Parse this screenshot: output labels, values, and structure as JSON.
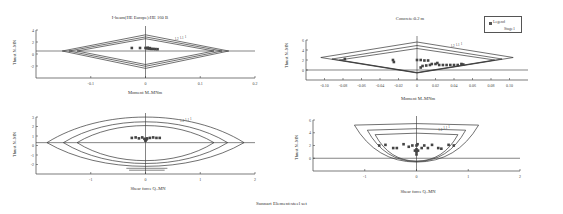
{
  "figure_caption": "Sunnart Element:steel set",
  "legend": {
    "title": "Legend",
    "entry": "Stage1"
  },
  "colors": {
    "line": "#333333",
    "marker": "#444444",
    "axis": "#444444"
  },
  "chart_data": [
    {
      "id": "beam-moment",
      "type": "scatter",
      "title": "I-beam(HE Europe):HE 160 B",
      "xlabel": "Moment M–MNm",
      "ylabel": "Thrust N–MN",
      "xlim": [
        -0.2,
        0.2
      ],
      "ylim": [
        -4,
        4
      ],
      "xticks": [
        "-0.1",
        "0",
        "0.1",
        "0.2"
      ],
      "xtick_values": [
        -0.1,
        0,
        0.1,
        0.2
      ],
      "yticks": [
        "4",
        "2",
        "0",
        "-2"
      ],
      "ytick_values": [
        4,
        2,
        0,
        -2
      ],
      "baseline_y": 0.5,
      "grid": false,
      "curve_labels": [
        "1.2",
        "1.1",
        "1"
      ],
      "envelopes": [
        {
          "name": "1",
          "shape": "diamond",
          "xmin": -0.152,
          "xmax": 0.152,
          "ytop": 3.2,
          "ybot": -2.4,
          "ymid": 0.5
        },
        {
          "name": "1.1",
          "shape": "diamond",
          "xmin": -0.14,
          "xmax": 0.14,
          "ytop": 2.85,
          "ybot": -2.05,
          "ymid": 0.5
        },
        {
          "name": "1.2",
          "shape": "diamond",
          "xmin": -0.125,
          "xmax": 0.125,
          "ytop": 2.55,
          "ybot": -1.75,
          "ymid": 0.5
        }
      ],
      "points": [
        [
          -0.025,
          1.0
        ],
        [
          -0.01,
          1.0
        ],
        [
          0.0,
          1.0
        ],
        [
          0.003,
          0.95
        ],
        [
          0.006,
          0.9
        ],
        [
          0.01,
          0.85
        ],
        [
          0.014,
          0.85
        ],
        [
          0.018,
          0.82
        ],
        [
          0.022,
          0.8
        ],
        [
          0.004,
          1.05
        ],
        [
          0.008,
          0.98
        ]
      ]
    },
    {
      "id": "concrete-moment",
      "type": "scatter",
      "title": "Concrete:0.2 m",
      "xlabel": "Moment M–MNm",
      "ylabel": "Thrust N–MN",
      "xlim": [
        -0.12,
        0.12
      ],
      "ylim": [
        -2,
        6
      ],
      "xticks": [
        "-0.10",
        "-0.08",
        "-0.06",
        "-0.04",
        "-0.02",
        "0",
        "0.02",
        "0.04",
        "0.06",
        "0.08",
        "0.10"
      ],
      "xtick_values": [
        -0.1,
        -0.08,
        -0.06,
        -0.04,
        -0.02,
        0,
        0.02,
        0.04,
        0.06,
        0.08,
        0.1
      ],
      "yticks": [
        "6",
        "4",
        "2",
        "0"
      ],
      "ytick_values": [
        6,
        4,
        2,
        0
      ],
      "baseline_y": 0,
      "grid": false,
      "curve_labels": [
        "1.2",
        "1.1",
        "1"
      ],
      "envelopes": [
        {
          "name": "1",
          "shape": "diamond",
          "xmin": -0.104,
          "xmax": 0.104,
          "ytop": 5.6,
          "ybot": -0.6,
          "ymid": 2.5,
          "ymid_r": 2.5
        },
        {
          "name": "1.1",
          "shape": "diamond",
          "xmin": -0.092,
          "xmax": 0.092,
          "ytop": 4.9,
          "ybot": -0.55,
          "ymid": 2.2,
          "ymid_r": 2.2
        },
        {
          "name": "1.2",
          "shape": "diamond",
          "xmin": -0.084,
          "xmax": 0.084,
          "ytop": 4.3,
          "ybot": -0.5,
          "ymid": 2.0,
          "ymid_r": 2.0
        }
      ],
      "points": [
        [
          -0.078,
          2.2
        ],
        [
          -0.026,
          2.0
        ],
        [
          -0.025,
          1.6
        ],
        [
          0.0,
          2.0
        ],
        [
          0.004,
          2.0
        ],
        [
          0.008,
          1.9
        ],
        [
          0.012,
          1.9
        ],
        [
          0.004,
          0.5
        ],
        [
          0.006,
          0.8
        ],
        [
          0.01,
          0.9
        ],
        [
          0.014,
          1.0
        ],
        [
          0.016,
          1.2
        ],
        [
          0.02,
          1.2
        ],
        [
          0.022,
          1.4
        ],
        [
          0.024,
          1.0
        ],
        [
          0.028,
          1.0
        ],
        [
          0.032,
          1.0
        ],
        [
          0.036,
          1.0
        ],
        [
          0.04,
          1.0
        ],
        [
          0.044,
          1.0
        ],
        [
          0.048,
          1.2
        ],
        [
          0.05,
          1.1
        ]
      ]
    },
    {
      "id": "beam-shear",
      "type": "scatter",
      "title": "",
      "xlabel": "Shear force Q–MN",
      "ylabel": "Thrust N–MN",
      "xlim": [
        -2,
        2
      ],
      "ylim": [
        -3,
        3
      ],
      "xticks": [
        "-1",
        "0",
        "1",
        "2"
      ],
      "xtick_values": [
        -1,
        0,
        1,
        2
      ],
      "yticks": [
        "3",
        "2",
        "1",
        "0",
        "-1",
        "-2"
      ],
      "ytick_values": [
        3,
        2,
        1,
        0,
        -1,
        -2
      ],
      "baseline_y": 0.3,
      "grid": false,
      "curve_labels": [
        "1.2",
        "1.1",
        "1"
      ],
      "envelopes": [
        {
          "name": "1",
          "shape": "lens",
          "xmin": -1.8,
          "xmax": 1.8,
          "ytop": 3.0,
          "ybot": -2.2,
          "ymid": 0.3
        },
        {
          "name": "1.1",
          "shape": "lens",
          "xmin": -1.5,
          "xmax": 1.5,
          "ytop": 2.5,
          "ybot": -1.9,
          "ymid": 0.3
        },
        {
          "name": "1.2",
          "shape": "lens",
          "xmin": -1.25,
          "xmax": 1.25,
          "ytop": 2.1,
          "ybot": -1.6,
          "ymid": 0.3
        }
      ],
      "extra_lines": [
        {
          "x1": -0.35,
          "x2": 0.4,
          "y": -2.4
        },
        {
          "x1": -0.3,
          "x2": 0.35,
          "y": -2.6
        }
      ],
      "points": [
        [
          -0.25,
          0.8
        ],
        [
          -0.18,
          0.85
        ],
        [
          -0.12,
          0.75
        ],
        [
          -0.06,
          0.85
        ],
        [
          0.0,
          0.6
        ],
        [
          0.0,
          0.5
        ],
        [
          0.03,
          0.75
        ],
        [
          0.08,
          0.8
        ],
        [
          0.14,
          0.85
        ],
        [
          0.2,
          0.8
        ],
        [
          0.26,
          0.8
        ],
        [
          -0.02,
          0.7
        ],
        [
          0.02,
          0.65
        ]
      ]
    },
    {
      "id": "concrete-shear",
      "type": "scatter",
      "title": "",
      "xlabel": "Shear force Q–MN",
      "ylabel": "Thrust N–MN",
      "xlim": [
        -2,
        2
      ],
      "ylim": [
        -2,
        6
      ],
      "xticks": [
        "-1",
        "0",
        "1",
        "2"
      ],
      "xtick_values": [
        -1,
        0,
        1,
        2
      ],
      "yticks": [
        "6",
        "4",
        "2",
        "0"
      ],
      "ytick_values": [
        6,
        4,
        2,
        0
      ],
      "baseline_y": 0,
      "grid": false,
      "curve_labels": [
        "1.2",
        "1.1",
        "1"
      ],
      "envelopes": [
        {
          "name": "1",
          "shape": "bowl",
          "xmin": -1.2,
          "xmax": 1.2,
          "ytop": 5.2,
          "ybot": -0.6,
          "ymid": 5.2
        },
        {
          "name": "1.1",
          "shape": "bowl",
          "xmin": -0.95,
          "xmax": 0.95,
          "ytop": 4.4,
          "ybot": -0.5,
          "ymid": 4.4
        },
        {
          "name": "1.2",
          "shape": "bowl",
          "xmin": -0.8,
          "xmax": 0.8,
          "ytop": 3.7,
          "ybot": -0.45,
          "ymid": 3.7
        }
      ],
      "points": [
        [
          -0.72,
          2.0
        ],
        [
          -0.6,
          2.1
        ],
        [
          -0.45,
          1.6
        ],
        [
          -0.38,
          1.6
        ],
        [
          -0.25,
          2.2
        ],
        [
          -0.15,
          1.8
        ],
        [
          -0.08,
          2.0
        ],
        [
          0.0,
          2.0
        ],
        [
          0.02,
          2.2
        ],
        [
          0.1,
          1.6
        ],
        [
          0.15,
          2.0
        ],
        [
          0.22,
          1.6
        ],
        [
          0.3,
          2.1
        ],
        [
          0.42,
          1.6
        ],
        [
          0.48,
          1.5
        ],
        [
          0.62,
          2.1
        ],
        [
          0.72,
          2.0
        ],
        [
          0.0,
          1.4
        ],
        [
          0.0,
          1.0
        ],
        [
          0.0,
          0.6
        ],
        [
          -0.03,
          1.2
        ],
        [
          0.03,
          1.2
        ]
      ]
    }
  ]
}
